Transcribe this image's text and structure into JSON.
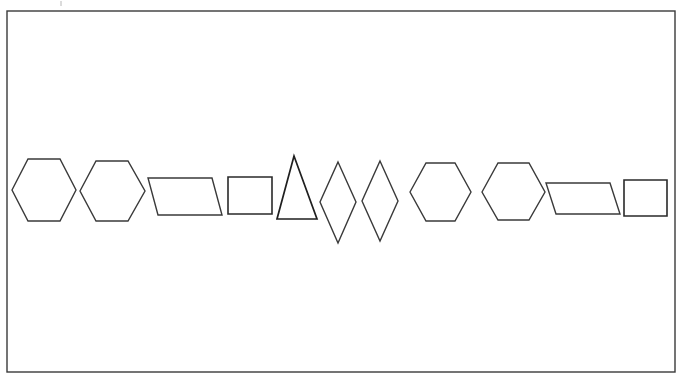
{
  "figure": {
    "canvas": {
      "width": 681,
      "height": 383,
      "background": "#ffffff"
    },
    "frame": {
      "name": "outer-border-rectangle",
      "x": 7,
      "y": 11,
      "width": 668,
      "height": 361,
      "stroke": "#3a3a3a",
      "stroke_width": 1.4,
      "fill": "none"
    },
    "artifact": {
      "name": "scan-speck",
      "x": 60,
      "y": 1,
      "width": 2,
      "height": 5,
      "stroke": "#b8b8b8"
    },
    "stroke_color": "#3a3a3a",
    "stroke_color_dark": "#1f1f1f",
    "stroke_width": 1.4,
    "shape_count": 11,
    "shapes": [
      {
        "index": 1,
        "name": "hexagon-1",
        "type": "hexagon",
        "orientation": "flat-left-right-points",
        "points": "12,190 28,159 60,159 76,190 60,221 28,221",
        "bbox": {
          "x": 12,
          "y": 159,
          "width": 64,
          "height": 62
        },
        "stroke": "#3a3a3a",
        "stroke_width": 1.4
      },
      {
        "index": 2,
        "name": "hexagon-2",
        "type": "hexagon",
        "orientation": "flat-left-right-points",
        "points": "80,191 96,161 128,161 145,191 128,221 96,221",
        "bbox": {
          "x": 80,
          "y": 161,
          "width": 65,
          "height": 60
        },
        "stroke": "#3a3a3a",
        "stroke_width": 1.4
      },
      {
        "index": 3,
        "name": "parallelogram-1",
        "type": "parallelogram",
        "orientation": "slant-right",
        "points": "148,178 212,178 222,215 158,215",
        "bbox": {
          "x": 148,
          "y": 178,
          "width": 74,
          "height": 37
        },
        "stroke": "#3a3a3a",
        "stroke_width": 1.4
      },
      {
        "index": 4,
        "name": "square-1",
        "type": "square",
        "orientation": "upright",
        "points": "228,177 272,177 272,214 228,214",
        "bbox": {
          "x": 228,
          "y": 177,
          "width": 44,
          "height": 37
        },
        "stroke": "#2a2a2a",
        "stroke_width": 1.6
      },
      {
        "index": 5,
        "name": "triangle-1",
        "type": "triangle",
        "orientation": "apex-up",
        "points": "294,156 317,219 277,219",
        "bbox": {
          "x": 277,
          "y": 156,
          "width": 40,
          "height": 63
        },
        "stroke": "#1f1f1f",
        "stroke_width": 1.7
      },
      {
        "index": 6,
        "name": "diamond-1",
        "type": "diamond",
        "orientation": "tall-vertical",
        "points": "338,162 356,202 338,243 320,202",
        "bbox": {
          "x": 320,
          "y": 162,
          "width": 36,
          "height": 81
        },
        "stroke": "#3a3a3a",
        "stroke_width": 1.4
      },
      {
        "index": 7,
        "name": "diamond-2",
        "type": "diamond",
        "orientation": "tall-vertical",
        "points": "380,161 398,201 380,241 362,201",
        "bbox": {
          "x": 362,
          "y": 161,
          "width": 36,
          "height": 80
        },
        "stroke": "#3a3a3a",
        "stroke_width": 1.4
      },
      {
        "index": 8,
        "name": "hexagon-3",
        "type": "hexagon",
        "orientation": "flat-left-right-points",
        "points": "410,192 426,163 455,163 471,192 455,221 426,221",
        "bbox": {
          "x": 410,
          "y": 163,
          "width": 61,
          "height": 58
        },
        "stroke": "#3a3a3a",
        "stroke_width": 1.4
      },
      {
        "index": 9,
        "name": "hexagon-4",
        "type": "hexagon",
        "orientation": "flat-left-right-points",
        "points": "482,192 498,163 529,163 545,192 529,220 498,220",
        "bbox": {
          "x": 482,
          "y": 163,
          "width": 63,
          "height": 57
        },
        "stroke": "#3a3a3a",
        "stroke_width": 1.4
      },
      {
        "index": 10,
        "name": "parallelogram-2",
        "type": "parallelogram",
        "orientation": "slant-right",
        "points": "546,183 610,183 620,214 556,214",
        "bbox": {
          "x": 546,
          "y": 183,
          "width": 74,
          "height": 31
        },
        "stroke": "#3a3a3a",
        "stroke_width": 1.4
      },
      {
        "index": 11,
        "name": "square-2",
        "type": "square",
        "orientation": "upright",
        "points": "624,180 667,180 667,216 624,216",
        "bbox": {
          "x": 624,
          "y": 180,
          "width": 43,
          "height": 36
        },
        "stroke": "#2a2a2a",
        "stroke_width": 1.6
      }
    ]
  }
}
